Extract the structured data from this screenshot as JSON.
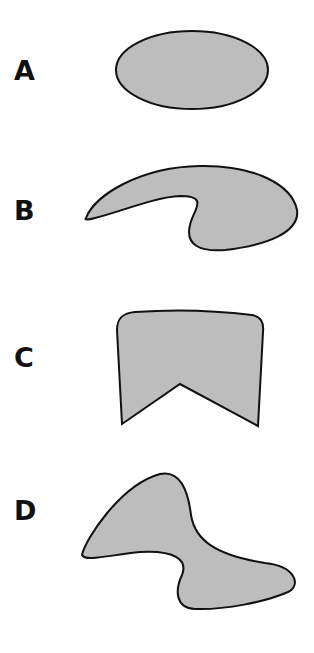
{
  "figure": {
    "shapes": [
      {
        "label": "A",
        "description": "ellipse"
      },
      {
        "label": "B",
        "description": "curved hook-shaped blob"
      },
      {
        "label": "C",
        "description": "rounded-top shape with V-notch at bottom"
      },
      {
        "label": "D",
        "description": "S-shaped curved blob"
      }
    ],
    "colors": {
      "fill": "#bdbdbd",
      "stroke": "#111111"
    }
  }
}
